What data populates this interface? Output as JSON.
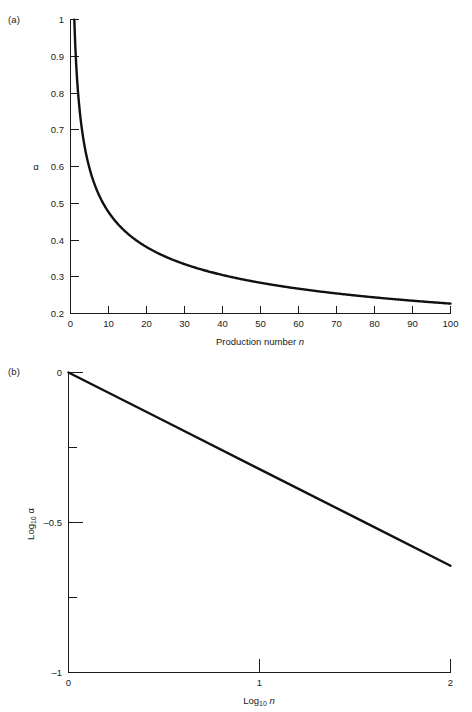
{
  "figure": {
    "panels": [
      {
        "tag": "(a)",
        "ylabel": "α",
        "xlabel_text": "Production number ",
        "xlabel_italic": "n",
        "x_ticks": [
          "0",
          "10",
          "20",
          "30",
          "40",
          "50",
          "60",
          "70",
          "80",
          "90",
          "100"
        ],
        "y_ticks": [
          "0.2",
          "0.3",
          "0.4",
          "0.5",
          "0.6",
          "0.7",
          "0.8",
          "0.9",
          "1"
        ]
      },
      {
        "tag": "(b)",
        "ylabel_text": "Log",
        "ylabel_sub": "10",
        "ylabel_sym": "α",
        "xlabel_text": "Log",
        "xlabel_sub": "10",
        "xlabel_italic": "n",
        "x_ticks": [
          "0",
          "1",
          "2"
        ],
        "y_ticks": [
          "–1",
          "–0.5",
          "0"
        ]
      }
    ]
  },
  "chart_data": [
    {
      "type": "line",
      "title": "(a)",
      "xlabel": "Production number n",
      "ylabel": "α",
      "xlim": [
        0,
        100
      ],
      "ylim": [
        0.2,
        1.0
      ],
      "xticks": [
        0,
        10,
        20,
        30,
        40,
        50,
        60,
        70,
        80,
        90,
        100
      ],
      "yticks": [
        0.2,
        0.3,
        0.4,
        0.5,
        0.6,
        0.7,
        0.8,
        0.9,
        1.0
      ],
      "grid": false,
      "legend": "none",
      "series": [
        {
          "name": "alpha = n^-0.322",
          "x": [
            1,
            2,
            3,
            4,
            5,
            6,
            7,
            8,
            9,
            10,
            12,
            14,
            16,
            18,
            20,
            25,
            30,
            35,
            40,
            45,
            50,
            55,
            60,
            65,
            70,
            75,
            80,
            85,
            90,
            95,
            100
          ],
          "y": [
            1.0,
            0.8,
            0.706,
            0.64,
            0.593,
            0.556,
            0.527,
            0.512,
            0.492,
            0.476,
            0.447,
            0.424,
            0.41,
            0.394,
            0.381,
            0.355,
            0.336,
            0.322,
            0.311,
            0.301,
            0.292,
            0.285,
            0.278,
            0.272,
            0.267,
            0.262,
            0.258,
            0.254,
            0.25,
            0.247,
            0.224
          ]
        }
      ]
    },
    {
      "type": "line",
      "title": "(b)",
      "xlabel": "Log10 n",
      "ylabel": "Log10 alpha",
      "xlim": [
        0,
        2
      ],
      "ylim": [
        -1,
        0
      ],
      "xticks": [
        0,
        1,
        2
      ],
      "yticks": [
        -1,
        -0.5,
        0
      ],
      "grid": false,
      "legend": "none",
      "series": [
        {
          "name": "log10 alpha = -0.322 * log10 n",
          "x": [
            0,
            0.5,
            1.0,
            1.5,
            2.0
          ],
          "y": [
            0,
            -0.161,
            -0.322,
            -0.483,
            -0.644
          ]
        }
      ]
    }
  ]
}
